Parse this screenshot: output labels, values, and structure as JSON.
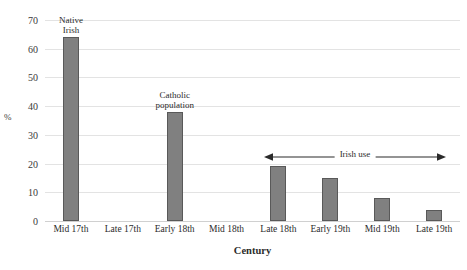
{
  "chart_data": {
    "type": "bar",
    "title": "The Gaelic and Catholic contexts in Ireland",
    "xlabel": "Century",
    "ylabel": "%",
    "ylim": [
      0,
      70
    ],
    "ytick_step": 10,
    "yticks": [
      "70",
      "60",
      "50",
      "40",
      "30",
      "20",
      "10",
      "0"
    ],
    "grid": true,
    "legend": "none",
    "categories": [
      "Mid 17th",
      "Late 17th",
      "Early 18th",
      "Mid 18th",
      "Late 18th",
      "Early 19th",
      "Mid 19th",
      "Late 19th"
    ],
    "values": [
      64,
      null,
      38,
      null,
      19,
      15,
      8,
      4
    ],
    "bar_color": "#808080",
    "bar_border_color": "#595959",
    "gridline_color": "#e3e3e3",
    "annotations": [
      {
        "text": "Native\nIrish",
        "line1": "Native",
        "line2": "Irish",
        "category": "Mid 17th",
        "index": 0
      },
      {
        "text": "Catholic\npopulation",
        "line1": "Catholic",
        "line2": "population",
        "category": "Early 18th",
        "index": 2
      },
      {
        "text": "Irish use",
        "type": "double-arrow",
        "from_category": "Late 18th",
        "to_category": "Late 19th"
      }
    ]
  }
}
